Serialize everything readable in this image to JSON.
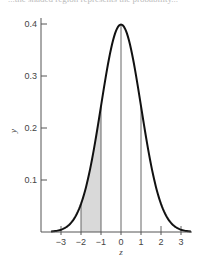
{
  "caption": "...the shaded region represents the probability...",
  "chart_data": {
    "type": "line",
    "xlabel": "z",
    "ylabel": "y",
    "xlim": [
      -3.5,
      3.5
    ],
    "ylim": [
      0,
      0.4
    ],
    "x_ticks": [
      "-3",
      "-2",
      "-1",
      "0",
      "1",
      "2",
      "3"
    ],
    "y_ticks": [
      "0.1",
      "0.2",
      "0.3",
      "0.4"
    ],
    "series": [
      {
        "name": "standard normal pdf",
        "x": [
          -3.5,
          -3,
          -2.5,
          -2,
          -1.5,
          -1,
          -0.5,
          0,
          0.5,
          1,
          1.5,
          2,
          2.5,
          3,
          3.5
        ],
        "values": [
          0.0009,
          0.0044,
          0.0175,
          0.054,
          0.1295,
          0.242,
          0.3521,
          0.3989,
          0.3521,
          0.242,
          0.1295,
          0.054,
          0.0175,
          0.0044,
          0.0009
        ]
      }
    ],
    "vertical_lines_at": [
      -2,
      -1,
      0,
      1
    ],
    "shaded_region": {
      "from": -2,
      "to": -1,
      "color": "#d9d9d9"
    },
    "grid": false,
    "legend": "none"
  }
}
